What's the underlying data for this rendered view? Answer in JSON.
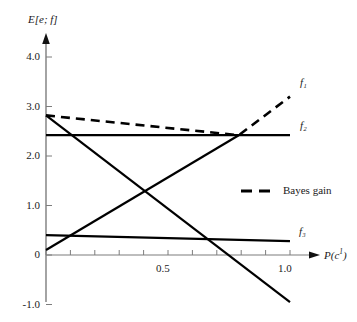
{
  "chart_data": {
    "type": "line",
    "title": "",
    "xlabel": "P(c¹)",
    "ylabel": "E[e; f]",
    "xlim": [
      0,
      1.08
    ],
    "ylim": [
      -1.0,
      4.3
    ],
    "grid": false,
    "legend_position": "center-right",
    "x_ticks": [
      {
        "value": 0.0,
        "label": ""
      },
      {
        "value": 0.1,
        "label": ""
      },
      {
        "value": 0.2,
        "label": ""
      },
      {
        "value": 0.3,
        "label": ""
      },
      {
        "value": 0.4,
        "label": ""
      },
      {
        "value": 0.5,
        "label": "0.5"
      },
      {
        "value": 0.6,
        "label": ""
      },
      {
        "value": 0.7,
        "label": ""
      },
      {
        "value": 0.8,
        "label": ""
      },
      {
        "value": 0.9,
        "label": ""
      },
      {
        "value": 1.0,
        "label": "1.0"
      }
    ],
    "y_ticks": [
      {
        "value": 4.0,
        "label": "4.0"
      },
      {
        "value": 3.0,
        "label": "3.0"
      },
      {
        "value": 2.0,
        "label": "2.0"
      },
      {
        "value": 1.0,
        "label": "1.0"
      },
      {
        "value": 0.0,
        "label": "0"
      },
      {
        "value": -1.0,
        "label": "-1.0"
      }
    ],
    "series": [
      {
        "name": "f1-bayes-gain",
        "label": "f₁",
        "style": "dashed",
        "color": "#000000",
        "points": [
          [
            0.0,
            2.82
          ],
          [
            0.79,
            2.42
          ],
          [
            1.0,
            3.2
          ]
        ]
      },
      {
        "name": "f2",
        "label": "f₂",
        "style": "solid",
        "color": "#000000",
        "points": [
          [
            0.0,
            2.42
          ],
          [
            1.0,
            2.42
          ]
        ]
      },
      {
        "name": "f3",
        "label": "f₃",
        "style": "solid",
        "color": "#000000",
        "points": [
          [
            0.0,
            0.4
          ],
          [
            1.0,
            0.28
          ]
        ]
      },
      {
        "name": "descending-line",
        "label": "",
        "style": "solid",
        "color": "#000000",
        "points": [
          [
            0.0,
            2.82
          ],
          [
            1.0,
            -0.95
          ]
        ]
      },
      {
        "name": "rising-line",
        "label": "",
        "style": "solid",
        "color": "#000000",
        "points": [
          [
            0.0,
            0.1
          ],
          [
            0.79,
            2.42
          ]
        ]
      }
    ],
    "curve_labels": [
      {
        "name": "f1",
        "text": "f₁",
        "x": 300,
        "y": 76
      },
      {
        "name": "f2",
        "text": "f₂",
        "x": 300,
        "y": 119
      },
      {
        "name": "f3",
        "text": "f₃",
        "x": 299,
        "y": 225
      }
    ],
    "legend": [
      {
        "name": "bayes-gain",
        "label": "Bayes gain",
        "style": "dashed",
        "color": "#000000"
      }
    ]
  },
  "axes": {
    "y_title": "E[e; f]",
    "x_title_base": "P(c",
    "x_title_sup": "1",
    "x_title_close": ")"
  },
  "colors": {
    "axis": "#7d7d7d",
    "curve": "#000000",
    "text": "#1a1a1a",
    "background": "#ffffff"
  }
}
